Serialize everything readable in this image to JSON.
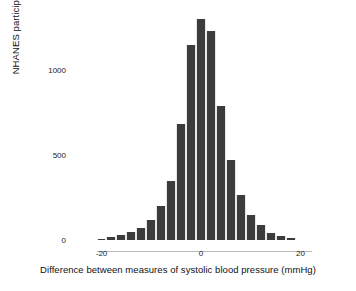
{
  "chart_data": {
    "type": "bar",
    "title": "",
    "subtitle": "",
    "xlabel": "Difference between measures of systolic blood pressure (mmHg)",
    "ylabel": "NHANES participants",
    "grid": false,
    "legend": "none",
    "bin_width": 2,
    "xlim": [
      -22,
      22
    ],
    "ylim": [
      0,
      1380
    ],
    "xticks": [
      -20,
      0,
      20
    ],
    "xtick_labels": [
      "-20",
      "0",
      "20"
    ],
    "yticks": [
      0,
      500,
      1000
    ],
    "ytick_labels": [
      "0",
      "500",
      "1000"
    ],
    "bar_color": "#3c3c3c",
    "categories": [
      -20,
      -18,
      -16,
      -14,
      -12,
      -10,
      -8,
      -6,
      -4,
      -2,
      0,
      2,
      4,
      6,
      8,
      10,
      12,
      14,
      16,
      18
    ],
    "values": [
      8,
      18,
      30,
      45,
      70,
      115,
      200,
      350,
      680,
      1150,
      1300,
      1230,
      790,
      470,
      265,
      145,
      90,
      40,
      22,
      12
    ],
    "bars": [
      {
        "x": -20,
        "value": 8
      },
      {
        "x": -18,
        "value": 18
      },
      {
        "x": -16,
        "value": 30
      },
      {
        "x": -14,
        "value": 45
      },
      {
        "x": -12,
        "value": 70
      },
      {
        "x": -10,
        "value": 115
      },
      {
        "x": -8,
        "value": 200
      },
      {
        "x": -6,
        "value": 350
      },
      {
        "x": -4,
        "value": 680
      },
      {
        "x": -2,
        "value": 1150
      },
      {
        "x": 0,
        "value": 1300
      },
      {
        "x": 2,
        "value": 1230
      },
      {
        "x": 4,
        "value": 790
      },
      {
        "x": 6,
        "value": 470
      },
      {
        "x": 8,
        "value": 265
      },
      {
        "x": 10,
        "value": 145
      },
      {
        "x": 12,
        "value": 90
      },
      {
        "x": 14,
        "value": 40
      },
      {
        "x": 16,
        "value": 22
      },
      {
        "x": 18,
        "value": 12
      }
    ]
  }
}
